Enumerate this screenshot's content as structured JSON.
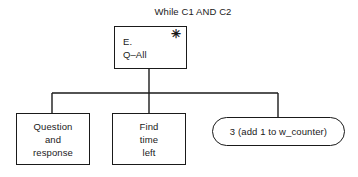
{
  "diagram": {
    "title": "While C1 AND C2",
    "background_color": "#ffffff",
    "line_color": "#1a1a1a",
    "root": {
      "line1": "E.",
      "line2": "Q–All",
      "marker": "✳",
      "marker_name": "asterisk-marker"
    },
    "children": [
      {
        "id": "question-and-response",
        "shape": "rectangle",
        "line1": "Question",
        "line2": "and",
        "line3": "response"
      },
      {
        "id": "find-time-left",
        "shape": "rectangle",
        "line1": "Find",
        "line2": "time",
        "line3": "left"
      },
      {
        "id": "add-one-to-w-counter",
        "shape": "rounded-rectangle",
        "line1": "3 (add 1 to w_counter)"
      }
    ]
  }
}
